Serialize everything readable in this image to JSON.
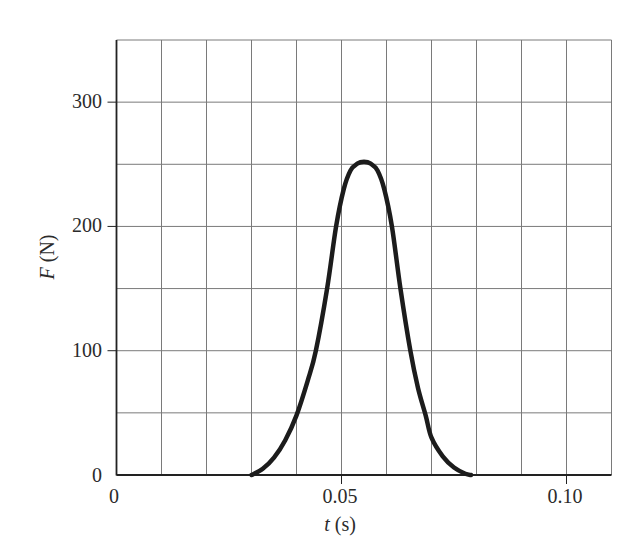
{
  "chart_data": {
    "type": "line",
    "title": "",
    "xlabel": "t (s)",
    "ylabel": "F (N)",
    "xlabel_parts": {
      "var": "t",
      "unit": " (s)"
    },
    "ylabel_parts": {
      "var": "F",
      "unit": " (N)"
    },
    "xlim": [
      0,
      0.11
    ],
    "ylim": [
      0,
      350
    ],
    "grid": true,
    "grid_x_step": 0.01,
    "grid_y_step": 50,
    "x_tick_labels": [
      {
        "value": 0,
        "label": "0"
      },
      {
        "value": 0.05,
        "label": "0.05"
      },
      {
        "value": 0.1,
        "label": "0.10"
      }
    ],
    "y_tick_labels": [
      {
        "value": 0,
        "label": "0"
      },
      {
        "value": 100,
        "label": "100"
      },
      {
        "value": 200,
        "label": "200"
      },
      {
        "value": 300,
        "label": "300"
      }
    ],
    "legend": null,
    "series": [
      {
        "name": "F(t)",
        "color": "#1c1c1c",
        "x": [
          0.03,
          0.0325,
          0.035,
          0.0375,
          0.04,
          0.0425,
          0.0443,
          0.0468,
          0.0488,
          0.0505,
          0.052,
          0.0535,
          0.055,
          0.0565,
          0.058,
          0.0595,
          0.0612,
          0.0631,
          0.0653,
          0.067,
          0.0687,
          0.07,
          0.0725,
          0.075,
          0.0775,
          0.0788
        ],
        "y": [
          0,
          5,
          14,
          28,
          48,
          76,
          100,
          150,
          200,
          230,
          245,
          250.5,
          252,
          250.5,
          245,
          230,
          200,
          150,
          100,
          70,
          48,
          30,
          15,
          6,
          1,
          0
        ]
      }
    ],
    "peak": {
      "t": 0.055,
      "F": 252
    }
  },
  "colors": {
    "grid": "#7a7a7a",
    "axis": "#222222",
    "curve": "#1c1c1c",
    "background": "#ffffff"
  }
}
